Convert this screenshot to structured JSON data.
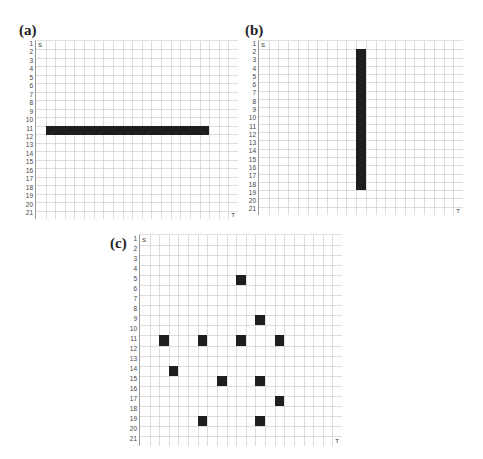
{
  "figure": {
    "panels": [
      {
        "id": "a",
        "label": "(a)",
        "rows": 21,
        "cols": 21,
        "start_marker": "S",
        "target_marker": "T",
        "row_labels": [
          "1",
          "2",
          "3",
          "4",
          "5",
          "6",
          "7",
          "8",
          "9",
          "10",
          "11",
          "12",
          "13",
          "14",
          "15",
          "16",
          "17",
          "18",
          "19",
          "20",
          "21"
        ],
        "obstacles": [
          {
            "type": "horizontal-bar",
            "row": 11,
            "col_start": 2,
            "col_end": 18
          }
        ]
      },
      {
        "id": "b",
        "label": "(b)",
        "rows": 21,
        "cols": 21,
        "start_marker": "S",
        "target_marker": "T",
        "row_labels": [
          "1",
          "2",
          "3",
          "4",
          "5",
          "6",
          "7",
          "8",
          "9",
          "10",
          "11",
          "12",
          "13",
          "14",
          "15",
          "16",
          "17",
          "18",
          "19",
          "20",
          "21"
        ],
        "obstacles": [
          {
            "type": "vertical-bar",
            "col": 11,
            "row_start": 2,
            "row_end": 18
          }
        ]
      },
      {
        "id": "c",
        "label": "(c)",
        "rows": 21,
        "cols": 21,
        "start_marker": "S",
        "target_marker": "T",
        "row_labels": [
          "1",
          "2",
          "3",
          "4",
          "5",
          "6",
          "7",
          "8",
          "9",
          "10",
          "11",
          "12",
          "13",
          "14",
          "15",
          "16",
          "17",
          "18",
          "19",
          "20",
          "21"
        ],
        "obstacles": [
          {
            "type": "cell",
            "row": 5,
            "col": 11
          },
          {
            "type": "cell",
            "row": 9,
            "col": 13
          },
          {
            "type": "cell",
            "row": 11,
            "col": 3
          },
          {
            "type": "cell",
            "row": 11,
            "col": 7
          },
          {
            "type": "cell",
            "row": 11,
            "col": 11
          },
          {
            "type": "cell",
            "row": 11,
            "col": 15
          },
          {
            "type": "cell",
            "row": 14,
            "col": 4
          },
          {
            "type": "cell",
            "row": 15,
            "col": 9
          },
          {
            "type": "cell",
            "row": 15,
            "col": 13
          },
          {
            "type": "cell",
            "row": 17,
            "col": 15
          },
          {
            "type": "cell",
            "row": 19,
            "col": 7
          },
          {
            "type": "cell",
            "row": 19,
            "col": 13
          }
        ]
      }
    ],
    "colors": {
      "obstacle": "#1e1e1e",
      "grid_line": "#d4d4d4",
      "background": "#ffffff"
    }
  }
}
